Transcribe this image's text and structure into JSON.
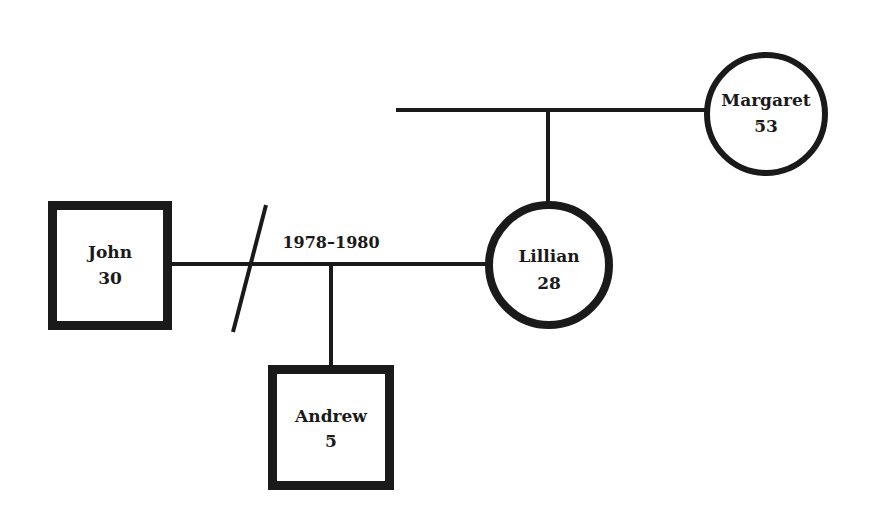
{
  "diagram": {
    "type": "genogram",
    "stroke_color": "#1a1a1a",
    "background": "#ffffff",
    "people": [
      {
        "id": "john",
        "name": "John",
        "age": "30",
        "sex": "male",
        "shape": "square"
      },
      {
        "id": "andrew",
        "name": "Andrew",
        "age": "5",
        "sex": "male",
        "shape": "square"
      },
      {
        "id": "lillian",
        "name": "Lillian",
        "age": "28",
        "sex": "female",
        "shape": "circle"
      },
      {
        "id": "margaret",
        "name": "Margaret",
        "age": "53",
        "sex": "female",
        "shape": "circle"
      }
    ],
    "relationships": [
      {
        "type": "marriage",
        "between": [
          "john",
          "lillian"
        ],
        "label": "1978–1980",
        "status": "divorced"
      },
      {
        "type": "parent-child",
        "parents": [
          "john",
          "lillian"
        ],
        "child": "andrew"
      },
      {
        "type": "parent-child",
        "parents": [
          "unknown",
          "margaret"
        ],
        "child": "lillian"
      }
    ],
    "marriage_label": "1978–1980"
  }
}
